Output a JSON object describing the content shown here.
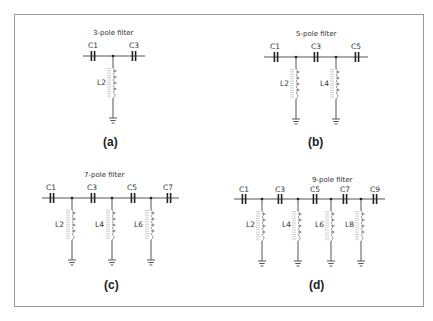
{
  "figure": {
    "panels": [
      {
        "id": "a",
        "label": "(a)",
        "title": "3-pole filter",
        "capacitors": [
          "C1",
          "C3"
        ],
        "inductors": [
          "L2"
        ]
      },
      {
        "id": "b",
        "label": "(b)",
        "title": "5-pole filter",
        "capacitors": [
          "C1",
          "C3",
          "C5"
        ],
        "inductors": [
          "L2",
          "L4"
        ]
      },
      {
        "id": "c",
        "label": "(c)",
        "title": "7-pole filter",
        "capacitors": [
          "C1",
          "C3",
          "C5",
          "C7"
        ],
        "inductors": [
          "L2",
          "L4",
          "L6"
        ]
      },
      {
        "id": "d",
        "label": "(d)",
        "title": "9-pole filter",
        "capacitors": [
          "C1",
          "C3",
          "C5",
          "C7",
          "C9"
        ],
        "inductors": [
          "L2",
          "L4",
          "L6",
          "L8"
        ]
      }
    ]
  }
}
